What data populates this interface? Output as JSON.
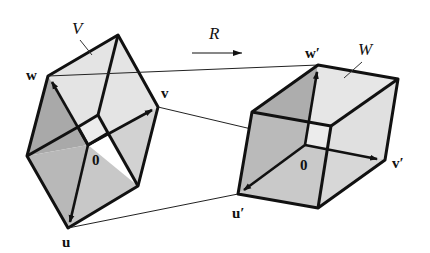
{
  "diagram": {
    "transform_label": "R",
    "left_solid": {
      "name_label": "V",
      "origin_label": "0",
      "vector_labels": {
        "u": "u",
        "v": "v",
        "w": "w"
      },
      "fill_colors": {
        "light": "#e4e4e4",
        "mid": "#c8c8c8",
        "dark": "#a9a9a9",
        "inner": "#ececec"
      }
    },
    "right_solid": {
      "name_label": "W",
      "origin_label": "0",
      "vector_labels": {
        "u": "u′",
        "v": "v′",
        "w": "w′"
      },
      "fill_colors": {
        "light": "#e6e6e6",
        "mid": "#cfcfcf",
        "dark": "#adadad",
        "inner": "#ececec"
      }
    },
    "mapping_lines": [
      "w → w′",
      "v → v′",
      "u → u′"
    ],
    "edge_color": "#111111"
  }
}
